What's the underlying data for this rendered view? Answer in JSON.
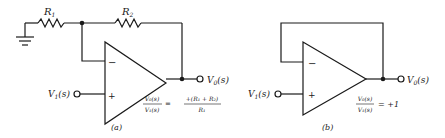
{
  "circuits": [
    {
      "id": "a",
      "caption": "(a)",
      "type": "non-inverting amplifier",
      "resistor1": {
        "label": "R",
        "sub": "1"
      },
      "resistor2": {
        "label": "R",
        "sub": "2"
      },
      "input": {
        "label": "V",
        "sub": "1",
        "arg": "(s)"
      },
      "output": {
        "label": "V",
        "sub": "0",
        "arg": "(s)"
      },
      "minus_sign": "−",
      "plus_sign": "+",
      "transfer": {
        "num_left": "V₀(s)",
        "den_left": "V₁(s)",
        "equals": "=",
        "num_right": "+(R₁ + R₂)",
        "den_right": "R₁"
      }
    },
    {
      "id": "b",
      "caption": "(b)",
      "type": "voltage follower",
      "input": {
        "label": "V",
        "sub": "1",
        "arg": "(s)"
      },
      "output": {
        "label": "V",
        "sub": "0",
        "arg": "(s)"
      },
      "minus_sign": "−",
      "plus_sign": "+",
      "transfer": {
        "num_left": "V₀(s)",
        "den_left": "V₁(s)",
        "equals": "= +1"
      }
    }
  ],
  "colors": {
    "ink": "#1a1a1a",
    "background": "#ffffff"
  }
}
